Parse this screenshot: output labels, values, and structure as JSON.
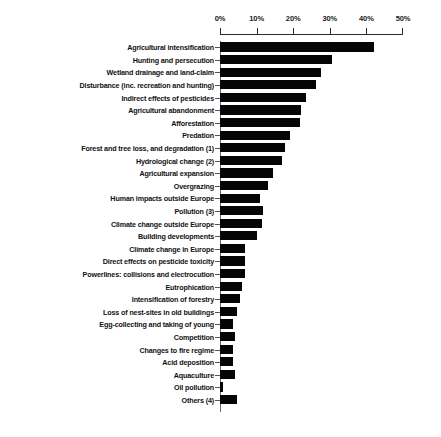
{
  "chart_data": {
    "type": "bar",
    "orientation": "horizontal",
    "title": "",
    "subtitle": "",
    "xlabel": "",
    "ylabel": "",
    "xlim": [
      0,
      50
    ],
    "x_tick_labels": [
      "0%",
      "10%",
      "20%",
      "30%",
      "40%",
      "50%"
    ],
    "x_ticks": [
      0,
      10,
      20,
      30,
      40,
      50
    ],
    "grid": false,
    "legend": null,
    "bar_color": "#050505",
    "axis_color": "#2b2b2b",
    "categories": [
      "Agricultural intensification",
      "Hunting and persecution",
      "Wetland drainage and land-claim",
      "Disturbance (inc. recreation and hunting)",
      "Indirect effects of pesticides",
      "Agricultural abandonment",
      "Afforestation",
      "Predation",
      "Forest and tree loss, and degradation (1)",
      "Hydrological change (2)",
      "Agricultural expansion",
      "Overgrazing",
      "Human impacts outside Europe",
      "Pollution (3)",
      "Climate change outside Europe",
      "Building developments",
      "Climate change in Europe",
      "Direct effects on pesticide toxicity",
      "Powerlines: collisions and electrocution",
      "Eutrophication",
      "Intensification of forestry",
      "Loss of nest-sites in old buildings",
      "Egg-collecting and taking of young",
      "Competition",
      "Changes to fire regime",
      "Acid deposition",
      "Aquaculture",
      "Oil pollution",
      "Others (4)"
    ],
    "values": [
      42.0,
      30.7,
      27.5,
      26.3,
      23.6,
      22.0,
      21.9,
      19.2,
      17.8,
      17.0,
      14.5,
      13.0,
      11.0,
      11.8,
      11.5,
      10.1,
      6.8,
      6.8,
      6.8,
      6.0,
      5.5,
      4.7,
      3.6,
      4.0,
      3.6,
      3.5,
      4.0,
      0.8,
      4.7
    ]
  }
}
